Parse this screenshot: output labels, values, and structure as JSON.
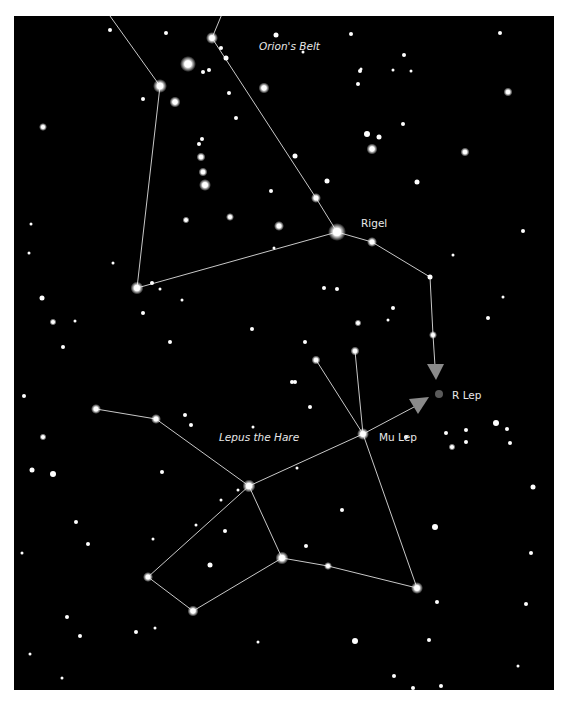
{
  "colors": {
    "sky": "#000000",
    "star": "#ffffff",
    "line": "#c8c8c8",
    "arrow": "#8a8a8a",
    "target": "#5a5a5a",
    "label": "#e8e8e8"
  },
  "labels": {
    "orions_belt": "Orion's Belt",
    "rigel": "Rigel",
    "lepus": "Lepus the Hare",
    "mu_lep": "Mu Lep",
    "r_lep": "R Lep"
  },
  "named_stars": [
    {
      "id": "rigel",
      "label": "Rigel",
      "brightness": "brightest"
    },
    {
      "id": "mu-lep",
      "label": "Mu Lep",
      "brightness": "bright"
    },
    {
      "id": "r-lep",
      "label": "R Lep",
      "brightness": "target (grey marker)"
    }
  ],
  "star_hop_paths": [
    {
      "from": "Rigel",
      "to": "R Lep",
      "marked_with": "arrow"
    },
    {
      "from": "Mu Lep",
      "to": "R Lep",
      "marked_with": "arrow"
    }
  ],
  "constellations": [
    "Orion",
    "Lepus"
  ]
}
